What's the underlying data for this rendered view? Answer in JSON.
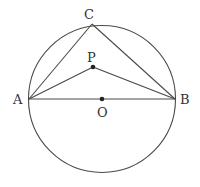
{
  "diagram": {
    "title": "",
    "points": [
      {
        "id": "A",
        "label": "A"
      },
      {
        "id": "B",
        "label": "B"
      },
      {
        "id": "C",
        "label": "C"
      },
      {
        "id": "P",
        "label": "P"
      },
      {
        "id": "O",
        "label": "O"
      }
    ],
    "segments": [
      [
        "A",
        "B"
      ],
      [
        "A",
        "C"
      ],
      [
        "C",
        "B"
      ],
      [
        "A",
        "P"
      ],
      [
        "P",
        "B"
      ]
    ],
    "circle": {
      "center": "O",
      "passes_through": [
        "A",
        "B",
        "C"
      ]
    },
    "marked_points": [
      "P",
      "O"
    ],
    "colors": {
      "line": "#4a4a4a",
      "point": "#222222",
      "text": "#333333"
    }
  }
}
